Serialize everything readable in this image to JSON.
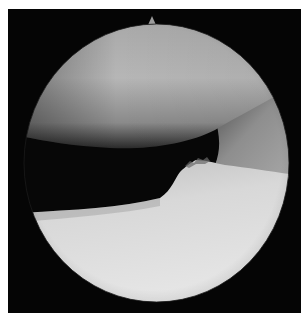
{
  "image": {
    "kind": "arthroscopic-view",
    "description": "Grayscale circular arthroscopic image of a joint showing an upper rounded condyle, a dark joint space, and a bright lower surface with an irregular tissue edge",
    "colors": {
      "page_background": "#ffffff",
      "frame_black": "#050505",
      "condyle_light": "#b8b8b8",
      "condyle_dark": "#3a3a3a",
      "joint_space": "#080808",
      "plateau_light": "#e4e4e4",
      "plateau_mid": "#c6c6c6",
      "side_gray": "#9a9a9a"
    }
  }
}
